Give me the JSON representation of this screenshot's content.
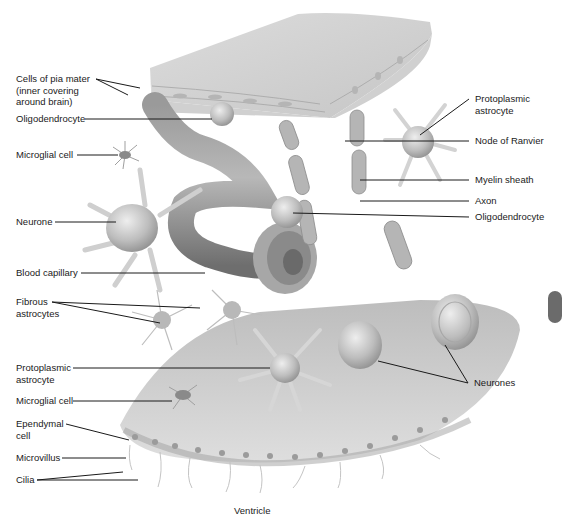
{
  "figure": {
    "bottom_label": "Ventricle",
    "colors": {
      "background": "#ffffff",
      "tissue_light": "#e4e4e4",
      "tissue_mid": "#c8c8c8",
      "tissue_dark": "#8c8c8c",
      "leader_line": "#1a1a1a",
      "text": "#1a1a1a"
    }
  },
  "left_labels": [
    {
      "id": "pia",
      "text": "Cells of pia mater\n(inner covering\naround brain)"
    },
    {
      "id": "oligo1",
      "text": "Oligodendrocyte"
    },
    {
      "id": "micro1",
      "text": "Microglial cell"
    },
    {
      "id": "neurone",
      "text": "Neurone"
    },
    {
      "id": "capillary",
      "text": "Blood capillary"
    },
    {
      "id": "fibrous",
      "text": "Fibrous\nastrocytes"
    },
    {
      "id": "proto2",
      "text": "Protoplasmic\nastrocyte"
    },
    {
      "id": "micro2",
      "text": "Microglial cell"
    },
    {
      "id": "ependymal",
      "text": "Ependymal\ncell"
    },
    {
      "id": "microvillus",
      "text": "Microvillus"
    },
    {
      "id": "cilia",
      "text": "Cilia"
    }
  ],
  "right_labels": [
    {
      "id": "proto1",
      "text": "Protoplasmic\nastrocyte"
    },
    {
      "id": "ranvier",
      "text": "Node of Ranvier"
    },
    {
      "id": "myelin",
      "text": "Myelin sheath"
    },
    {
      "id": "axon",
      "text": "Axon"
    },
    {
      "id": "oligo2",
      "text": "Oligodendrocyte"
    },
    {
      "id": "neurones",
      "text": "Neurones"
    }
  ]
}
